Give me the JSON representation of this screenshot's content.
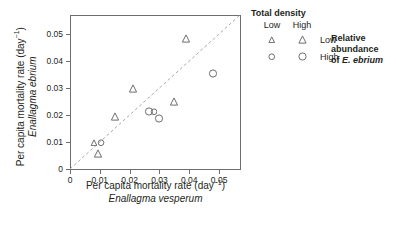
{
  "chart_data": {
    "type": "scatter",
    "title": "",
    "xlabel": "Per capita mortality rate (day⁻¹)",
    "xlabel_line1": "Per capita mortality rate (day",
    "xlabel_sup": "−1",
    "xlabel_line1_end": ")",
    "xlabel_species": "Enallagma vesperum",
    "ylabel_line1": "Per capita mortality rate (day",
    "ylabel_sup": "−1",
    "ylabel_line1_end": ")",
    "ylabel_species": "Enallagma ebrium",
    "xlim": [
      0,
      0.057
    ],
    "ylim": [
      0,
      0.057
    ],
    "xticks": [
      0,
      0.01,
      0.02,
      0.03,
      0.04,
      0.05
    ],
    "yticks": [
      0,
      0.01,
      0.02,
      0.03,
      0.04,
      0.05
    ],
    "xticklabels": [
      "0",
      "0.01",
      "0.02",
      "0.03",
      "0.04",
      "0.05"
    ],
    "yticklabels": [
      "0",
      "0.01",
      "0.02",
      "0.03",
      "0.04",
      "0.05"
    ],
    "grid": false,
    "reference_line": {
      "name": "one-to-one-line",
      "style": "dashed",
      "color": "#a7a9ac",
      "from": [
        0,
        0
      ],
      "to": [
        0.057,
        0.057
      ]
    },
    "marker_color": "#6d6e71",
    "points": [
      {
        "x": 0.008,
        "y": 0.0102,
        "shape": "triangle",
        "density": "low",
        "abundance": "low"
      },
      {
        "x": 0.0095,
        "y": 0.006,
        "shape": "triangle",
        "density": "high",
        "abundance": "low"
      },
      {
        "x": 0.0105,
        "y": 0.01,
        "shape": "circle",
        "density": "low",
        "abundance": "high"
      },
      {
        "x": 0.015,
        "y": 0.0195,
        "shape": "triangle",
        "density": "high",
        "abundance": "low"
      },
      {
        "x": 0.021,
        "y": 0.03,
        "shape": "triangle",
        "density": "high",
        "abundance": "low"
      },
      {
        "x": 0.0265,
        "y": 0.0215,
        "shape": "circle",
        "density": "high",
        "abundance": "high"
      },
      {
        "x": 0.028,
        "y": 0.0215,
        "shape": "circle",
        "density": "low",
        "abundance": "high"
      },
      {
        "x": 0.03,
        "y": 0.019,
        "shape": "circle",
        "density": "high",
        "abundance": "high"
      },
      {
        "x": 0.035,
        "y": 0.025,
        "shape": "triangle",
        "density": "high",
        "abundance": "low"
      },
      {
        "x": 0.039,
        "y": 0.0485,
        "shape": "triangle",
        "density": "high",
        "abundance": "low"
      },
      {
        "x": 0.048,
        "y": 0.0355,
        "shape": "circle",
        "density": "high",
        "abundance": "high"
      }
    ],
    "legend": {
      "position": "right",
      "title": "Total density",
      "columns": [
        "Low",
        "High"
      ],
      "rows": [
        {
          "label": "Low",
          "shape": "triangle"
        },
        {
          "label": "High",
          "shape": "circle"
        }
      ],
      "abundance_line1": "Relative",
      "abundance_line2": "abundance",
      "abundance_line3_prefix": "of ",
      "abundance_line3_species": "E. ebrium"
    }
  }
}
